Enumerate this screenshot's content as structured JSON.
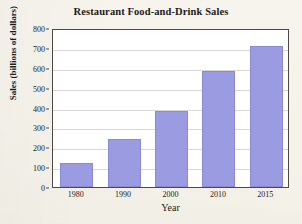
{
  "chart_data": {
    "type": "bar",
    "title": "Restaurant Food-and-Drink Sales",
    "xlabel": "Year",
    "ylabel": "Sales (billions of dollars)",
    "categories": [
      "1980",
      "1990",
      "2000",
      "2010",
      "2015"
    ],
    "values": [
      120,
      240,
      380,
      585,
      710
    ],
    "ylim": [
      0,
      800
    ],
    "yticks": [
      0,
      100,
      200,
      300,
      400,
      500,
      600,
      700,
      800
    ],
    "ytick_labels": [
      "0",
      "100",
      "200",
      "300",
      "400",
      "500",
      "600",
      "700",
      "800"
    ],
    "grid": "horizontal",
    "legend": "none",
    "bar_color": "#9b9be2",
    "bar_edge_color": "#8a8ad4",
    "plot_background": "#ffffff",
    "page_background": "#f6f3ec",
    "gridline_color": "#d8d8d8",
    "axis_color": "#4a4a46"
  }
}
